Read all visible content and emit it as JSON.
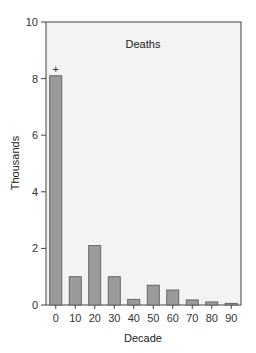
{
  "chart_data": {
    "type": "bar",
    "title": "Deaths",
    "xlabel": "Decade",
    "ylabel": "Thousands",
    "categories": [
      "0",
      "10",
      "20",
      "30",
      "40",
      "50",
      "60",
      "70",
      "80",
      "90"
    ],
    "values": [
      8.1,
      1.0,
      2.1,
      1.0,
      0.2,
      0.7,
      0.53,
      0.18,
      0.11,
      0.06
    ],
    "ylim": [
      0,
      10
    ],
    "yticks": [
      0,
      2,
      4,
      6,
      8,
      10
    ],
    "grid": false,
    "annotations": [
      {
        "category": "0",
        "text": "+"
      }
    ],
    "colors": {
      "bar_fill": "#9a9a9a",
      "bar_edge": "#555555",
      "plot_bg": "#f3f3f3",
      "frame": "#444444"
    }
  }
}
